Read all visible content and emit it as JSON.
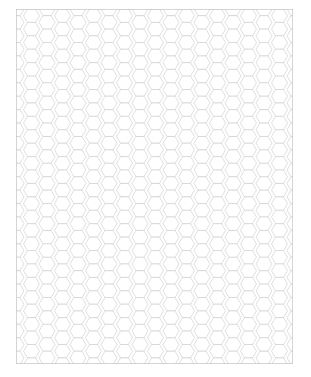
{
  "document": {
    "title": "Hexagonal Graph Paper",
    "page_width": 311,
    "page_height": 377,
    "background_color": "#ffffff"
  },
  "grid": {
    "name": "hexagon-grid",
    "orientation": "flat-top",
    "line_color": "#cacaca",
    "border_color": "#c4c4c4",
    "fill_color": "#ffffff",
    "line_width": 0.6,
    "border_width": 0.7,
    "region_x": 16,
    "region_y": 9,
    "region_width": 277,
    "region_height": 355,
    "hex_circumradius": 8.0,
    "column_pitch": 15.5,
    "row_pitch": 13.42,
    "columns": 20,
    "rows": 29,
    "stagger": "odd-columns-offset-half-row"
  },
  "chart_data": {
    "type": "table",
    "xlabel": "",
    "ylabel": "",
    "categories": [],
    "values": []
  }
}
